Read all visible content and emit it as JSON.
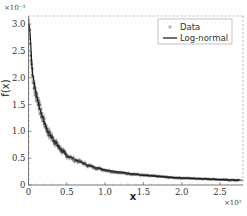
{
  "chart_data": {
    "type": "scatter",
    "title": "",
    "xlabel": "x",
    "ylabel": "f(x)",
    "x_multiplier": "×10²",
    "y_multiplier": "×10⁻³",
    "xlim": [
      0,
      2.8
    ],
    "ylim": [
      0,
      3.15
    ],
    "x_ticks": [
      0,
      0.5,
      1.0,
      1.5,
      2.0,
      2.5
    ],
    "x_tick_labels": [
      "0",
      "0.5",
      "1.0",
      "1.5",
      "2.0",
      "2.5"
    ],
    "y_ticks": [
      0,
      0.5,
      1.0,
      1.5,
      2.0,
      2.5,
      3.0
    ],
    "y_tick_labels": [
      "0",
      "0.5",
      "1.0",
      "1.5",
      "2.0",
      "2.5",
      "3.0"
    ],
    "grid": false,
    "legend_position": "upper right",
    "legend": [
      "Data",
      "Log-normal"
    ],
    "series": [
      {
        "name": "Data",
        "style": "markers with error bars",
        "color": "#999999",
        "x": [
          0.01,
          0.02,
          0.03,
          0.05,
          0.07,
          0.1,
          0.13,
          0.15,
          0.2,
          0.25,
          0.3,
          0.35,
          0.4,
          0.45,
          0.5,
          0.6,
          0.7,
          0.75,
          0.85,
          1.0,
          1.1,
          1.25,
          1.4,
          1.5,
          1.7,
          1.85,
          2.0,
          2.2,
          2.4,
          2.5,
          2.7
        ],
        "y": [
          2.9,
          2.85,
          2.4,
          2.1,
          1.85,
          1.7,
          1.55,
          1.4,
          1.2,
          1.0,
          0.9,
          0.8,
          0.7,
          0.62,
          0.55,
          0.47,
          0.42,
          0.38,
          0.33,
          0.28,
          0.25,
          0.22,
          0.2,
          0.18,
          0.16,
          0.14,
          0.13,
          0.12,
          0.11,
          0.1,
          0.09
        ]
      },
      {
        "name": "Log-normal",
        "style": "line",
        "color": "#111111",
        "x": [
          0.005,
          0.02,
          0.05,
          0.1,
          0.15,
          0.25,
          0.4,
          0.5,
          0.75,
          1.0,
          1.5,
          2.0,
          2.5,
          2.8
        ],
        "y": [
          3.0,
          2.9,
          2.1,
          1.7,
          1.4,
          1.0,
          0.7,
          0.55,
          0.38,
          0.28,
          0.18,
          0.13,
          0.1,
          0.09
        ]
      }
    ]
  }
}
